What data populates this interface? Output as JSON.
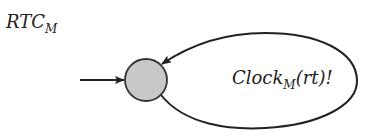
{
  "diagram": {
    "title": {
      "main": "RTC",
      "subscript": "M"
    },
    "state": {
      "name": "initial-state",
      "fill": "#c8c8c8",
      "stroke": "#333333"
    },
    "initial_arrow": {
      "label": ""
    },
    "transition": {
      "type": "self-loop",
      "label": {
        "main": "Clock",
        "subscript": "M",
        "suffix": "(rt)!"
      }
    },
    "colors": {
      "line": "#222222",
      "background": "#ffffff"
    }
  }
}
